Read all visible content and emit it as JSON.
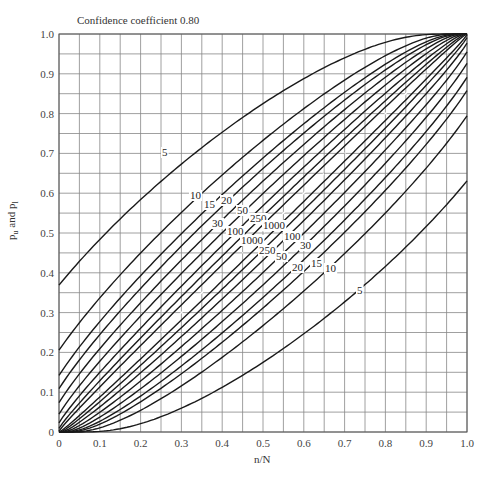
{
  "chart_data": {
    "type": "line",
    "title": "Confidence coefficient 0.80",
    "xlabel": "n/N",
    "ylabel": "p_u and p_l",
    "xlim": [
      0,
      1.0
    ],
    "ylim": [
      0,
      1.0
    ],
    "grid": true,
    "grid_step": 0.05,
    "x_ticks": [
      "0",
      "0.1",
      "0.2",
      "0.3",
      "0.4",
      "0.5",
      "0.6",
      "0.7",
      "0.8",
      "0.9",
      "1.0"
    ],
    "y_ticks": [
      "0",
      "0.1",
      "0.2",
      "0.3",
      "0.4",
      "0.5",
      "0.6",
      "0.7",
      "0.8",
      "0.9",
      "1.0"
    ],
    "confidence": 0.8,
    "sample_sizes": [
      5,
      10,
      15,
      20,
      30,
      50,
      100,
      250,
      1000
    ],
    "series_description": "For each sample size N, an upper curve p_u and a lower curve p_l bounding the 80% confidence belt; a dash-dot reference line along p = n/N.",
    "upper_intercepts_at_x0": {
      "5": 0.37,
      "10": 0.21,
      "15": 0.145,
      "20": 0.11,
      "30": 0.075,
      "50": 0.045,
      "100": 0.02,
      "250": 0.01,
      "1000": 0.0
    },
    "lower_intercepts_at_x1": {
      "5": 0.63,
      "10": 0.79,
      "15": 0.855,
      "20": 0.89,
      "30": 0.925,
      "50": 0.955,
      "100": 0.98,
      "250": 0.99,
      "1000": 1.0
    },
    "upper_labels": [
      {
        "text": "5",
        "x": 162,
        "y": 156
      },
      {
        "text": "10",
        "x": 190,
        "y": 199
      },
      {
        "text": "15",
        "x": 204,
        "y": 208
      },
      {
        "text": "20",
        "x": 221,
        "y": 204
      },
      {
        "text": "30",
        "x": 212,
        "y": 227
      },
      {
        "text": "50",
        "x": 237,
        "y": 214
      },
      {
        "text": "100",
        "x": 227,
        "y": 235
      },
      {
        "text": "250",
        "x": 250,
        "y": 222
      },
      {
        "text": "1000",
        "x": 241,
        "y": 244
      }
    ],
    "lower_labels": [
      {
        "text": "1000",
        "x": 263,
        "y": 229
      },
      {
        "text": "250",
        "x": 259,
        "y": 254
      },
      {
        "text": "100",
        "x": 284,
        "y": 240
      },
      {
        "text": "50",
        "x": 276,
        "y": 260
      },
      {
        "text": "30",
        "x": 300,
        "y": 249
      },
      {
        "text": "20",
        "x": 292,
        "y": 271
      },
      {
        "text": "15",
        "x": 311,
        "y": 267
      },
      {
        "text": "10",
        "x": 325,
        "y": 272
      },
      {
        "text": "5",
        "x": 357,
        "y": 294
      }
    ]
  }
}
